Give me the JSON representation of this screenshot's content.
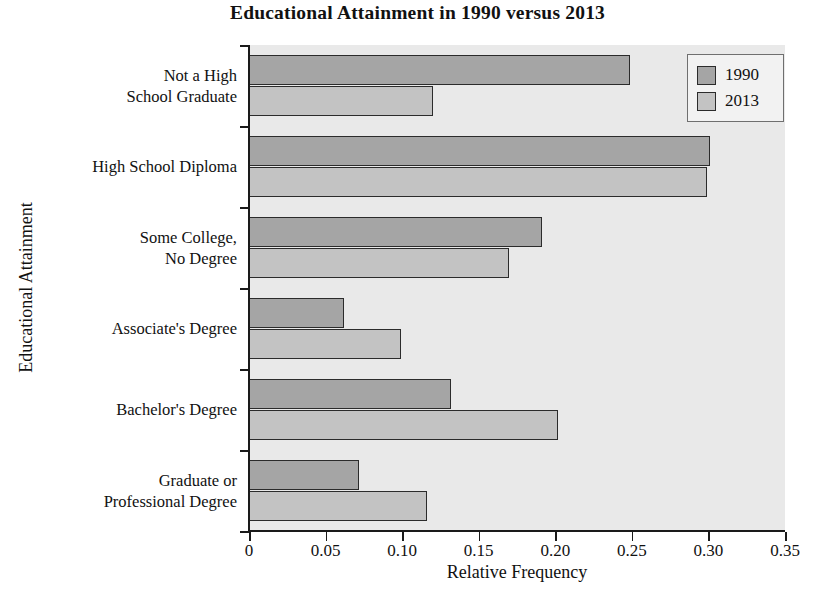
{
  "chart_data": {
    "type": "bar",
    "orientation": "horizontal",
    "title": "Educational Attainment in 1990 versus 2013",
    "xlabel": "Relative Frequency",
    "ylabel": "Educational Attainment",
    "xlim": [
      0,
      0.35
    ],
    "ylim": [
      0,
      6
    ],
    "grid": false,
    "legend_position": "top-right",
    "xticks": [
      "0",
      "0.05",
      "0.10",
      "0.15",
      "0.20",
      "0.25",
      "0.30",
      "0.35"
    ],
    "xtick_values": [
      0,
      0.05,
      0.1,
      0.15,
      0.2,
      0.25,
      0.3,
      0.35
    ],
    "categories": [
      "Not a High\nSchool Graduate",
      "High School Diploma",
      "Some College,\nNo Degree",
      "Associate's Degree",
      "Bachelor's Degree",
      "Graduate or\nProfessional Degree"
    ],
    "series": [
      {
        "name": "1990",
        "color": "#a5a5a5",
        "values": [
          0.249,
          0.301,
          0.191,
          0.062,
          0.132,
          0.072
        ]
      },
      {
        "name": "2013",
        "color": "#c3c3c3",
        "values": [
          0.12,
          0.299,
          0.17,
          0.099,
          0.202,
          0.116
        ]
      }
    ]
  },
  "legend": {
    "entries": [
      {
        "label": "1990",
        "color": "#a5a5a5"
      },
      {
        "label": "2013",
        "color": "#c3c3c3"
      }
    ]
  },
  "style": {
    "plot_background": "#e9e9e9",
    "page_background": "#ffffff",
    "axis_color": "#1a1a1a",
    "bar_outline": "#2b2b2b"
  }
}
